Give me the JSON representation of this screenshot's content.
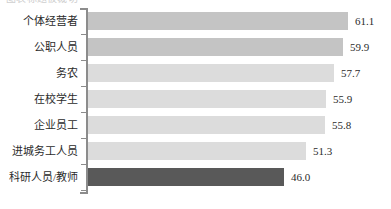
{
  "chart_data": {
    "type": "bar",
    "orientation": "horizontal",
    "title": "",
    "xlabel": "",
    "ylabel": "",
    "grid": false,
    "legend": null,
    "xlim": [
      0,
      61.1
    ],
    "categories": [
      "个体经营者",
      "公职人员",
      "务农",
      "在校学生",
      "企业员工",
      "进城务工人员",
      "科研人员/教师"
    ],
    "values": [
      61.1,
      59.9,
      57.7,
      55.9,
      55.8,
      51.3,
      46.0
    ],
    "value_labels": [
      "61.1",
      "59.9",
      "57.7",
      "55.9",
      "55.8",
      "51.3",
      "46.0"
    ],
    "bar_colors": [
      "#c4c4c4",
      "#c4c4c4",
      "#dcdcdc",
      "#dcdcdc",
      "#dcdcdc",
      "#dcdcdc",
      "#595959"
    ],
    "axis_color": "#8c8c8c"
  },
  "top_crop": {
    "text": "图表标题被裁切"
  }
}
